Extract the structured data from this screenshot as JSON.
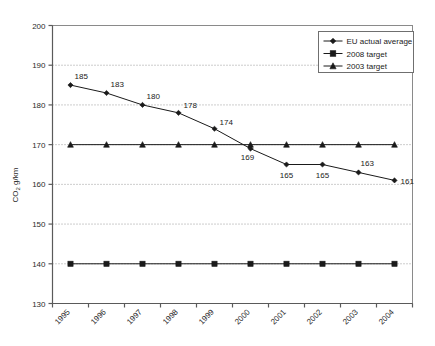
{
  "chart_data": {
    "type": "line",
    "title": "",
    "xlabel": "",
    "ylabel": "CO2 g/km",
    "ylabel_main": "CO",
    "ylabel_sub": "2",
    "ylabel_rest": " g/km",
    "categories": [
      "1995",
      "1996",
      "1997",
      "1998",
      "1999",
      "2000",
      "2001",
      "2002",
      "2003",
      "2004"
    ],
    "ylim": [
      130,
      200
    ],
    "yticks": [
      "130",
      "140",
      "150",
      "160",
      "170",
      "180",
      "190",
      "200"
    ],
    "grid": true,
    "grid_style": "dotted-horizontal",
    "legend_position": "top-right",
    "series": [
      {
        "name": "EU actual average",
        "marker": "diamond",
        "color": "#000000",
        "values": [
          185,
          183,
          180,
          178,
          174,
          169,
          165,
          165,
          163,
          161
        ],
        "labels": [
          "185",
          "183",
          "180",
          "178",
          "174",
          "169",
          "165",
          "165",
          "163",
          "161"
        ],
        "show_labels": true
      },
      {
        "name": "2008 target",
        "marker": "square",
        "color": "#000000",
        "values": [
          140,
          140,
          140,
          140,
          140,
          140,
          140,
          140,
          140,
          140
        ],
        "labels": [],
        "show_labels": false
      },
      {
        "name": "2003 target",
        "marker": "triangle",
        "color": "#000000",
        "values": [
          170,
          170,
          170,
          170,
          170,
          170,
          170,
          170,
          170,
          170
        ],
        "labels": [],
        "show_labels": false
      }
    ]
  },
  "legend": {
    "items": [
      {
        "label": "EU actual average",
        "marker": "diamond"
      },
      {
        "label": "2008 target",
        "marker": "square"
      },
      {
        "label": "2003 target",
        "marker": "triangle"
      }
    ]
  },
  "colors": {
    "series_line": "#1a1a1a",
    "plot_border": "#8a8a8a",
    "gridline": "#9a9a9a",
    "axis_line": "#6f6f6f",
    "background": "#ffffff",
    "text": "#1a1a1a"
  }
}
